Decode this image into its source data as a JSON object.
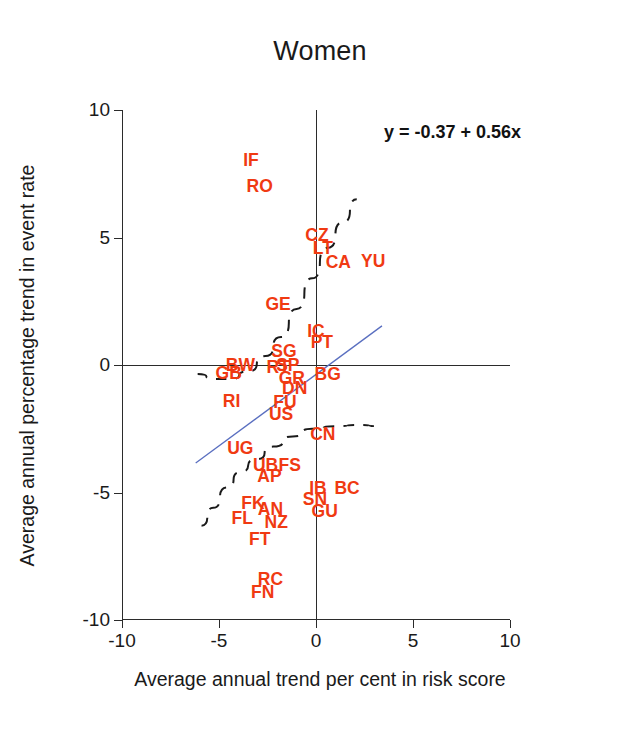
{
  "chart_data": {
    "type": "scatter",
    "title": "Women",
    "xlabel": "Average annual trend per cent in risk score",
    "ylabel": "Average annual percentage trend in event rate",
    "xlim": [
      -10,
      10
    ],
    "ylim": [
      -10,
      10
    ],
    "xticks": [
      "-10",
      "-5",
      "0",
      "5",
      "10"
    ],
    "xtick_values": [
      -10,
      -5,
      0,
      5,
      10
    ],
    "yticks": [
      "10",
      "5",
      "0",
      "-5",
      "-10"
    ],
    "ytick_values": [
      10,
      5,
      0,
      -5,
      -10
    ],
    "grid": false,
    "legend": "none",
    "annotation": "y = -0.37 + 0.56x",
    "marker_style": "text-label",
    "marker_color": "#f03a12",
    "fit_line": {
      "intercept": -0.37,
      "slope": 0.56,
      "color": "#5a6fc0",
      "style": "solid",
      "x_from": -6.2,
      "x_to": 3.4
    },
    "smoother_curves": {
      "color": "#1a1a1a",
      "style": "dashed",
      "upper": [
        [
          -6.1,
          -0.35
        ],
        [
          -5.2,
          -0.55
        ],
        [
          -4.4,
          -0.55
        ],
        [
          -3.5,
          -0.25
        ],
        [
          -2.6,
          0.35
        ],
        [
          -1.8,
          1.1
        ],
        [
          -1.0,
          2.2
        ],
        [
          -0.2,
          3.4
        ],
        [
          0.6,
          4.6
        ],
        [
          1.4,
          5.6
        ],
        [
          2.1,
          6.5
        ]
      ],
      "lower": [
        [
          -5.9,
          -6.3
        ],
        [
          -5.3,
          -5.6
        ],
        [
          -4.6,
          -4.8
        ],
        [
          -3.9,
          -4.2
        ],
        [
          -3.1,
          -3.7
        ],
        [
          -2.2,
          -3.2
        ],
        [
          -1.2,
          -2.8
        ],
        [
          -0.2,
          -2.5
        ],
        [
          1.0,
          -2.4
        ],
        [
          2.2,
          -2.35
        ],
        [
          3.3,
          -2.4
        ]
      ]
    },
    "points": [
      {
        "label": "IF",
        "x": -3.35,
        "y": 8.0
      },
      {
        "label": "RO",
        "x": -2.9,
        "y": 7.0
      },
      {
        "label": "CZ",
        "x": 0.05,
        "y": 5.05
      },
      {
        "label": "LT",
        "x": 0.35,
        "y": 4.55
      },
      {
        "label": "CA",
        "x": 1.15,
        "y": 4.0
      },
      {
        "label": "YU",
        "x": 2.95,
        "y": 4.05
      },
      {
        "label": "GE",
        "x": -1.95,
        "y": 2.35
      },
      {
        "label": "IC",
        "x": 0.0,
        "y": 1.3
      },
      {
        "label": "PT",
        "x": 0.3,
        "y": 0.85
      },
      {
        "label": "SG",
        "x": -1.65,
        "y": 0.5
      },
      {
        "label": "BW",
        "x": -3.9,
        "y": -0.05
      },
      {
        "label": "GB",
        "x": -4.5,
        "y": -0.35
      },
      {
        "label": "RT",
        "x": -1.95,
        "y": -0.1
      },
      {
        "label": "SP",
        "x": -1.45,
        "y": -0.05
      },
      {
        "label": "GR",
        "x": -1.25,
        "y": -0.55
      },
      {
        "label": "DN",
        "x": -1.1,
        "y": -0.95
      },
      {
        "label": "BG",
        "x": 0.6,
        "y": -0.4
      },
      {
        "label": "RI",
        "x": -4.35,
        "y": -1.45
      },
      {
        "label": "FU",
        "x": -1.6,
        "y": -1.5
      },
      {
        "label": "US",
        "x": -1.8,
        "y": -1.95
      },
      {
        "label": "UG",
        "x": -3.9,
        "y": -3.3
      },
      {
        "label": "CN",
        "x": 0.35,
        "y": -2.75
      },
      {
        "label": "UB",
        "x": -2.6,
        "y": -3.95
      },
      {
        "label": "AP",
        "x": -2.4,
        "y": -4.4
      },
      {
        "label": "FS",
        "x": -1.35,
        "y": -3.95
      },
      {
        "label": "IB",
        "x": 0.1,
        "y": -4.85
      },
      {
        "label": "BC",
        "x": 1.6,
        "y": -4.85
      },
      {
        "label": "SN",
        "x": -0.05,
        "y": -5.3
      },
      {
        "label": "GU",
        "x": 0.45,
        "y": -5.75
      },
      {
        "label": "FK",
        "x": -3.25,
        "y": -5.45
      },
      {
        "label": "AN",
        "x": -2.35,
        "y": -5.7
      },
      {
        "label": "NZ",
        "x": -2.05,
        "y": -6.2
      },
      {
        "label": "FL",
        "x": -3.8,
        "y": -6.05
      },
      {
        "label": "FT",
        "x": -2.9,
        "y": -6.85
      },
      {
        "label": "RC",
        "x": -2.35,
        "y": -8.45
      },
      {
        "label": "FN",
        "x": -2.75,
        "y": -8.95
      }
    ]
  }
}
